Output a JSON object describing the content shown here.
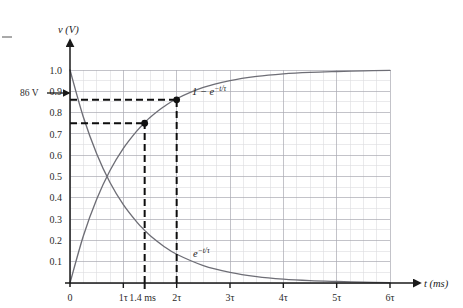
{
  "figure": {
    "background_color": "#ffffff",
    "grid_color_minor": "#d9d9dd",
    "grid_color_major": "#a8a8b0",
    "curve_color": "#6e6e76",
    "axis_color": "#1a1a1a",
    "dash_color": "#101010",
    "left_margin_tick": "–"
  },
  "axes": {
    "y_axis_title": "v (V)",
    "x_axis_title": "t (ms)",
    "y_ticks": [
      "0.1",
      "0.2",
      "0.3",
      "0.4",
      "0.5",
      "0.6",
      "0.7",
      "0.8",
      "0.9",
      "1.0"
    ],
    "y_tick_values": [
      0.1,
      0.2,
      0.3,
      0.4,
      0.5,
      0.6,
      0.7,
      0.8,
      0.9,
      1.0
    ],
    "x_origin_label": "0",
    "x_ticks": [
      "1τ",
      "2τ",
      "3τ",
      "4τ",
      "5τ",
      "6τ"
    ],
    "x_tick_values": [
      1,
      2,
      3,
      4,
      5,
      6
    ],
    "x_special_tick": "1.4 ms",
    "x_special_value": 1.4,
    "xlim": [
      0,
      6
    ],
    "ylim": [
      0,
      1.0
    ],
    "grid": true,
    "minor_grid_divisions_x": 4,
    "minor_grid_divisions_y": 2
  },
  "annotations": {
    "left_arrow_label": "86 V",
    "left_arrow_value": 0.86,
    "rising_curve_label": "1 − e",
    "rising_curve_exponent": "−t/τ",
    "falling_curve_label": "e",
    "falling_curve_exponent": "−t/τ"
  },
  "chart_data": {
    "type": "line",
    "title": "",
    "xlabel": "t (ms)",
    "ylabel": "v (V)",
    "xlim": [
      0,
      6
    ],
    "ylim": [
      0,
      1.0
    ],
    "grid": true,
    "x_tick_labels": [
      "0",
      "1τ",
      "1.4 ms",
      "2τ",
      "3τ",
      "4τ",
      "5τ",
      "6τ"
    ],
    "x_tick_positions": [
      0,
      1,
      1.4,
      2,
      3,
      4,
      5,
      6
    ],
    "y_tick_labels": [
      "0.1",
      "0.2",
      "0.3",
      "0.4",
      "0.5",
      "0.6",
      "0.7",
      "0.8",
      "0.9",
      "1.0"
    ],
    "y_tick_positions": [
      0.1,
      0.2,
      0.3,
      0.4,
      0.5,
      0.6,
      0.7,
      0.8,
      0.9,
      1.0
    ],
    "series": [
      {
        "name": "1 − e^{−t/τ}",
        "type": "line",
        "color": "#6e6e76",
        "x": [
          0,
          0.25,
          0.5,
          0.75,
          1.0,
          1.25,
          1.4,
          1.5,
          1.75,
          2.0,
          2.5,
          3.0,
          3.5,
          4.0,
          4.5,
          5.0,
          5.5,
          6.0
        ],
        "y": [
          0.0,
          0.221,
          0.393,
          0.528,
          0.632,
          0.713,
          0.753,
          0.777,
          0.826,
          0.865,
          0.918,
          0.95,
          0.97,
          0.982,
          0.989,
          0.993,
          0.996,
          0.998
        ]
      },
      {
        "name": "e^{−t/τ}",
        "type": "line",
        "color": "#6e6e76",
        "x": [
          0,
          0.25,
          0.5,
          0.75,
          1.0,
          1.25,
          1.4,
          1.5,
          1.75,
          2.0,
          2.5,
          3.0,
          3.5,
          4.0,
          4.5,
          5.0,
          5.5,
          6.0
        ],
        "y": [
          1.0,
          0.779,
          0.607,
          0.472,
          0.368,
          0.287,
          0.247,
          0.223,
          0.174,
          0.135,
          0.082,
          0.05,
          0.03,
          0.018,
          0.011,
          0.007,
          0.004,
          0.002
        ]
      }
    ],
    "markers": [
      {
        "name": "point-1p4ms",
        "x": 1.4,
        "y": 0.75,
        "label": "1.4 ms",
        "value_label": "0.75"
      },
      {
        "name": "point-2tau",
        "x": 2.0,
        "y": 0.86,
        "label": "2τ",
        "value_label": "0.86"
      }
    ],
    "guide_lines": [
      {
        "name": "hline-0p86",
        "orientation": "horizontal",
        "value": 0.86,
        "from": 0,
        "to": 2.0,
        "style": "dashed"
      },
      {
        "name": "hline-0p75",
        "orientation": "horizontal",
        "value": 0.75,
        "from": 0,
        "to": 1.4,
        "style": "dashed"
      },
      {
        "name": "vline-1p4ms",
        "orientation": "vertical",
        "value": 1.4,
        "from": 0,
        "to": 0.75,
        "style": "dashed"
      },
      {
        "name": "vline-2tau",
        "orientation": "vertical",
        "value": 2.0,
        "from": 0,
        "to": 0.86,
        "style": "dashed"
      }
    ],
    "annotations": [
      {
        "name": "annotation-86V",
        "text": "86 V",
        "x": -0.55,
        "y": 0.86,
        "arrow": true
      },
      {
        "name": "annotation-rising-curve",
        "text": "1 − e^{−t/τ}",
        "x": 2.25,
        "y": 0.875
      },
      {
        "name": "annotation-falling-curve",
        "text": "e^{−t/τ}",
        "x": 2.25,
        "y": 0.175
      }
    ]
  }
}
